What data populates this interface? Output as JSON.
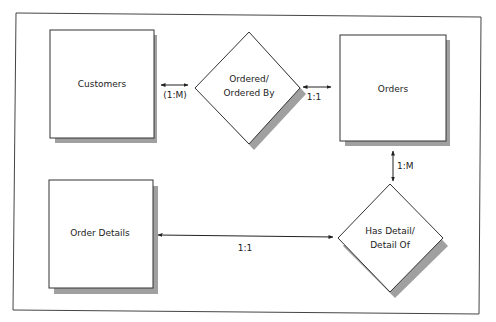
{
  "diagram": {
    "type": "entity-relationship",
    "entities": [
      {
        "id": "customers",
        "label": "Customers"
      },
      {
        "id": "orders",
        "label": "Orders"
      },
      {
        "id": "order_details",
        "label": "Order Details"
      }
    ],
    "relationships": [
      {
        "id": "ordered",
        "line1": "Ordered/",
        "line2": "Ordered By"
      },
      {
        "id": "has_detail",
        "line1": "Has Detail/",
        "line2": "Detail Of"
      }
    ],
    "connectors": [
      {
        "from": "customers",
        "to": "ordered",
        "label": "(1:M)"
      },
      {
        "from": "ordered",
        "to": "orders",
        "label": "1:1"
      },
      {
        "from": "orders",
        "to": "has_detail",
        "label": "1:M"
      },
      {
        "from": "order_details",
        "to": "has_detail",
        "label": "1:1"
      }
    ]
  },
  "colors": {
    "stroke": "#333333",
    "shadow": "#9a9a9a",
    "fill": "#ffffff"
  }
}
